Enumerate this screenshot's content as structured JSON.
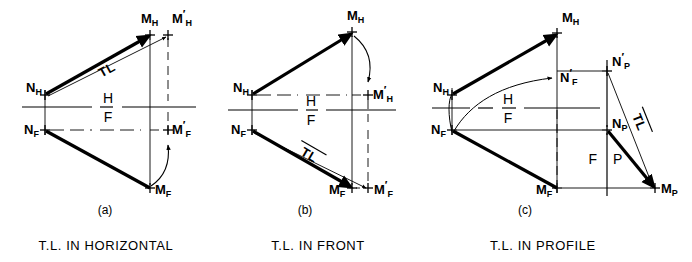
{
  "figure": {
    "background_color": "#ffffff",
    "ink_color": "#000000",
    "width": 692,
    "height": 262,
    "topic": "Descriptive geometry: true length of a line by auxiliary views"
  },
  "panels": [
    {
      "id": "a",
      "panel_label": "(a)",
      "caption": "T.L. IN HORIZONTAL",
      "tl_label": "TL",
      "reference_line": {
        "upper": "H",
        "lower": "F"
      },
      "points": [
        {
          "name": "N_H",
          "base": "N",
          "sub": "H",
          "prime": false,
          "x": 45,
          "y": 95
        },
        {
          "name": "M_H",
          "base": "M",
          "sub": "H",
          "prime": false,
          "x": 150,
          "y": 35
        },
        {
          "name": "M_H'",
          "base": "M",
          "sub": "H",
          "prime": true,
          "x": 168,
          "y": 35
        },
        {
          "name": "N_F",
          "base": "N",
          "sub": "F",
          "prime": false,
          "x": 45,
          "y": 130
        },
        {
          "name": "M_F",
          "base": "M",
          "sub": "F",
          "prime": false,
          "x": 150,
          "y": 188
        },
        {
          "name": "M_F'",
          "base": "M",
          "sub": "F",
          "prime": true,
          "x": 168,
          "y": 130
        }
      ],
      "true_length_view": "horizontal"
    },
    {
      "id": "b",
      "panel_label": "(b)",
      "caption": "T.L. IN FRONT",
      "tl_label": "TL",
      "reference_line": {
        "upper": "H",
        "lower": "F"
      },
      "points": [
        {
          "name": "N_H",
          "base": "N",
          "sub": "H",
          "prime": false,
          "x": 252,
          "y": 95
        },
        {
          "name": "M_H",
          "base": "M",
          "sub": "H",
          "prime": false,
          "x": 352,
          "y": 32
        },
        {
          "name": "M_H'",
          "base": "M",
          "sub": "H",
          "prime": true,
          "x": 368,
          "y": 95
        },
        {
          "name": "N_F",
          "base": "N",
          "sub": "F",
          "prime": false,
          "x": 252,
          "y": 130
        },
        {
          "name": "M_F",
          "base": "M",
          "sub": "F",
          "prime": false,
          "x": 352,
          "y": 188
        },
        {
          "name": "M_F'",
          "base": "M",
          "sub": "F",
          "prime": true,
          "x": 368,
          "y": 188
        }
      ],
      "true_length_view": "front"
    },
    {
      "id": "c",
      "panel_label": "(c)",
      "caption": "T.L. IN PROFILE",
      "tl_label": "TL",
      "reference_line": {
        "upper": "H",
        "lower": "F"
      },
      "profile_reference_line": {
        "left": "F",
        "right": "P"
      },
      "points": [
        {
          "name": "N_H",
          "base": "N",
          "sub": "H",
          "prime": false,
          "x": 452,
          "y": 95
        },
        {
          "name": "M_H",
          "base": "M",
          "sub": "H",
          "prime": false,
          "x": 557,
          "y": 33
        },
        {
          "name": "N_F'",
          "base": "N",
          "sub": "F",
          "prime": true,
          "x": 557,
          "y": 78
        },
        {
          "name": "N_F",
          "base": "N",
          "sub": "F",
          "prime": false,
          "x": 452,
          "y": 130
        },
        {
          "name": "M_F",
          "base": "M",
          "sub": "F",
          "prime": false,
          "x": 557,
          "y": 188
        },
        {
          "name": "N_P'",
          "base": "N",
          "sub": "P",
          "prime": true,
          "x": 607,
          "y": 71
        },
        {
          "name": "N_P",
          "base": "N",
          "sub": "P",
          "prime": false,
          "x": 607,
          "y": 130
        },
        {
          "name": "M_P",
          "base": "M",
          "sub": "P",
          "prime": false,
          "x": 655,
          "y": 188
        }
      ],
      "true_length_view": "profile"
    }
  ]
}
